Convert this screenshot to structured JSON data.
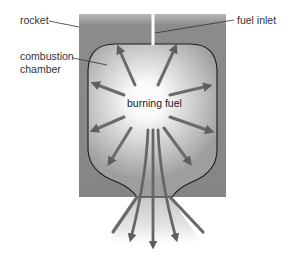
{
  "diagram": {
    "labels": {
      "rocket": "rocket",
      "combustion_chamber_line1": "combustion",
      "combustion_chamber_line2": "chamber",
      "fuel_inlet": "fuel inlet",
      "burning_fuel": "burning fuel"
    },
    "colors": {
      "rocket_body": "#8a8a8a",
      "chamber_outline": "#1a1a1a",
      "arrows": "#6b6b6b",
      "glow_center": "#ffffff",
      "background": "#ffffff",
      "label_text": "#333333"
    }
  }
}
